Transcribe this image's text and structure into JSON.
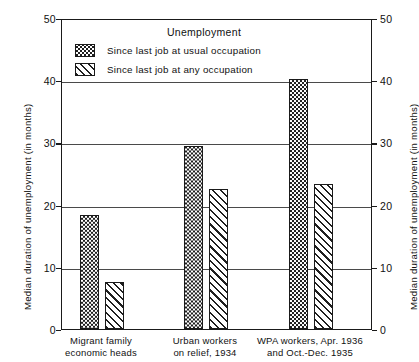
{
  "chart_data": {
    "type": "bar",
    "title": "Unemployment",
    "xlabel": "",
    "ylabel": "Median duration of unemployment (in months)",
    "ylabel_right": "Median duration of unemployment (in months)",
    "ylim": [
      0,
      50
    ],
    "yticks": [
      "0",
      "10",
      "20",
      "30",
      "40",
      "50"
    ],
    "grid": true,
    "legend_position": "top-center-inside",
    "categories": [
      "Migrant family economic heads",
      "Urban workers on relief, 1934",
      "WPA workers, Apr. 1936 and Oct.-Dec. 1935"
    ],
    "category_lines": [
      [
        "Migrant  family",
        "economic  heads"
      ],
      [
        "Urban workers",
        "on relief, 1934"
      ],
      [
        "WPA workers, Apr. 1936",
        "and Oct.-Dec. 1935"
      ]
    ],
    "series": [
      {
        "name": "Since last job at usual occupation",
        "pattern": "checkerboard",
        "values": [
          18.3,
          29.5,
          40.2
        ]
      },
      {
        "name": "Since last job at any occupation",
        "pattern": "diagonal-hatch",
        "values": [
          7.6,
          22.5,
          23.3
        ]
      }
    ]
  },
  "colors": {
    "ink": "#1a1a1a",
    "grid": "#4a4a4a",
    "background": "#ffffff"
  }
}
